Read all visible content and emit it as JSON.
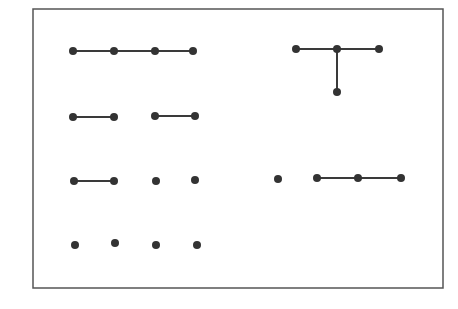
{
  "diagram": {
    "title": "",
    "colors": {
      "frame": "#555555",
      "edge": "#3a3a3a",
      "node": "#333333",
      "background": "#ffffff"
    },
    "frame": {
      "x": 33,
      "y": 9,
      "width": 410,
      "height": 279
    },
    "node_radius": 4,
    "groups": [
      {
        "name": "path-4-nodes",
        "nodes": [
          [
            73,
            51
          ],
          [
            114,
            51
          ],
          [
            155,
            51
          ],
          [
            193,
            51
          ]
        ],
        "edges": [
          [
            0,
            1
          ],
          [
            1,
            2
          ],
          [
            2,
            3
          ]
        ]
      },
      {
        "name": "t-shape",
        "nodes": [
          [
            296,
            49
          ],
          [
            337,
            49
          ],
          [
            379,
            49
          ],
          [
            337,
            92
          ]
        ],
        "edges": [
          [
            0,
            1
          ],
          [
            1,
            2
          ],
          [
            1,
            3
          ]
        ]
      },
      {
        "name": "pair-a",
        "nodes": [
          [
            73,
            117
          ],
          [
            114,
            117
          ]
        ],
        "edges": [
          [
            0,
            1
          ]
        ]
      },
      {
        "name": "pair-b",
        "nodes": [
          [
            155,
            116
          ],
          [
            195,
            116
          ]
        ],
        "edges": [
          [
            0,
            1
          ]
        ]
      },
      {
        "name": "pair-c",
        "nodes": [
          [
            74,
            181
          ],
          [
            114,
            181
          ]
        ],
        "edges": [
          [
            0,
            1
          ]
        ]
      },
      {
        "name": "single-a",
        "nodes": [
          [
            156,
            181
          ]
        ],
        "edges": []
      },
      {
        "name": "single-b",
        "nodes": [
          [
            195,
            180
          ]
        ],
        "edges": []
      },
      {
        "name": "single-c",
        "nodes": [
          [
            278,
            179
          ]
        ],
        "edges": []
      },
      {
        "name": "path-3-nodes",
        "nodes": [
          [
            317,
            178
          ],
          [
            358,
            178
          ],
          [
            401,
            178
          ]
        ],
        "edges": [
          [
            0,
            1
          ],
          [
            1,
            2
          ]
        ]
      },
      {
        "name": "single-d",
        "nodes": [
          [
            75,
            245
          ]
        ],
        "edges": []
      },
      {
        "name": "single-e",
        "nodes": [
          [
            115,
            243
          ]
        ],
        "edges": []
      },
      {
        "name": "single-f",
        "nodes": [
          [
            156,
            245
          ]
        ],
        "edges": []
      },
      {
        "name": "single-g",
        "nodes": [
          [
            197,
            245
          ]
        ],
        "edges": []
      }
    ]
  }
}
